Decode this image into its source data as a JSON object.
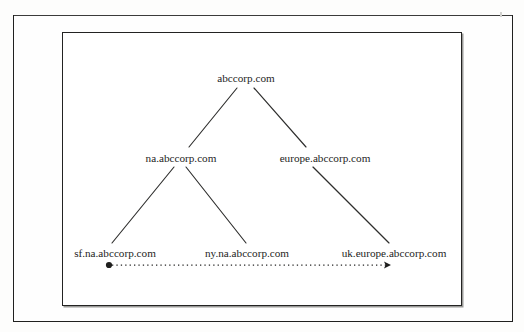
{
  "figure": {
    "root_label": "abccorp.com",
    "level2": {
      "left_label": "na.abccorp.com",
      "right_label": "europe.abccorp.com"
    },
    "leaves": {
      "first_label": "sf.na.abccorp.com",
      "second_label": "ny.na.abccorp.com",
      "third_label": "uk.europe.abccorp.com"
    },
    "flow": {
      "name": "dotted-flow-arrow",
      "start_marker": "filled-circle",
      "end_marker": "arrowhead-right",
      "style": "dotted"
    },
    "colors": {
      "ink": "#242423",
      "frame": "#232322",
      "page": "#fefefe",
      "scan_bar": "#a9a9a7"
    }
  }
}
